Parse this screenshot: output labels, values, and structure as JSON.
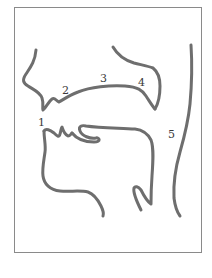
{
  "figure": {
    "title": "",
    "labels": [
      {
        "id": "1",
        "text": "1",
        "x": 38,
        "y": 126
      },
      {
        "id": "2",
        "text": "2",
        "x": 62,
        "y": 94
      },
      {
        "id": "3",
        "text": "3",
        "x": 100,
        "y": 82
      },
      {
        "id": "4",
        "text": "4",
        "x": 138,
        "y": 86
      },
      {
        "id": "5",
        "text": "5",
        "x": 168,
        "y": 138
      }
    ],
    "colors": {
      "stroke": "#6e6e6e",
      "frame": "#8a8a8a",
      "label": "#3a3a3a",
      "background": "#ffffff"
    }
  }
}
